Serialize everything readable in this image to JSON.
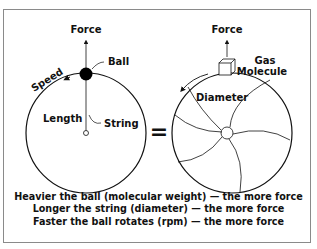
{
  "left_diagram": {
    "force_label": "Force",
    "ball_label": "Ball",
    "speed_label": "Speed",
    "length_label": "Length",
    "string_label": "String"
  },
  "equals_sign": "=",
  "right_diagram": {
    "force_label": "Force",
    "gas_label": "Gas",
    "molecule_label": "Molecule",
    "diameter_label": "Diameter"
  },
  "caption": {
    "lines": [
      "Heavier the ball (molecular weight) — the more force",
      "Longer the string (diameter) — the more force",
      "Faster the ball rotates (rpm) — the more force"
    ]
  },
  "colors": {
    "line": "#111111",
    "frame": "#8a8a8a",
    "background": "#ffffff"
  }
}
